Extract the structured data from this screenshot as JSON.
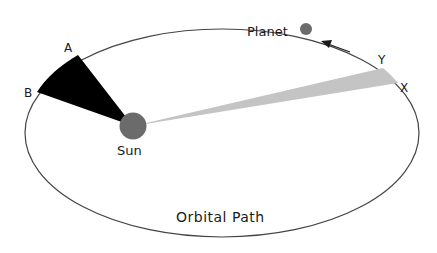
{
  "diagram": {
    "labels": {
      "planet": "Planet",
      "sun": "Sun",
      "orbit": "Orbital Path",
      "point_a": "A",
      "point_b": "B",
      "point_x": "X",
      "point_y": "Y"
    },
    "colors": {
      "orbit": "#444444",
      "sun": "#6b6b6b",
      "planet": "#6b6b6b",
      "sector_ab": "#000000",
      "sector_xy": "#c4c4c4",
      "arrow": "#1a1a1a"
    },
    "elements": {
      "orbit": "ellipse",
      "sector_ab": "swept area near aphelion side (black wedge A–B)",
      "sector_xy": "swept area far side (gray wedge Y–X)",
      "motion_arrow": "direction of planet motion (counter-clockwise)"
    }
  }
}
